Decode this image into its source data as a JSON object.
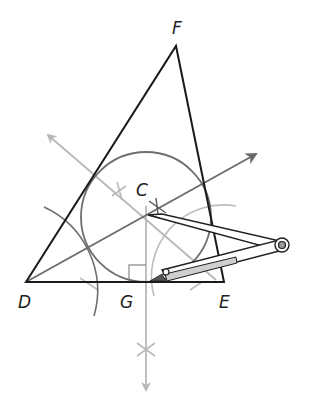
{
  "diagram": {
    "labels": {
      "F": "F",
      "C": "C",
      "D": "D",
      "G": "G",
      "E": "E"
    },
    "points": {
      "D": [
        26,
        282
      ],
      "E": [
        224,
        282
      ],
      "F": [
        176,
        46
      ],
      "C": [
        147,
        216
      ],
      "G": [
        146,
        282
      ]
    },
    "incircle": {
      "center": [
        146,
        217
      ],
      "radius": 65
    },
    "colors": {
      "triangle": "#1a1a1a",
      "circle": "#6e6e6e",
      "bisector_dark": "#6a6a6a",
      "construction_light": "#b8b8b8",
      "compass": "#1f1f1f"
    },
    "elements": [
      "triangle DEF",
      "angle bisector from D (dark gray ray)",
      "angle bisector from F side (light gray ray)",
      "perpendicular from C to DE (light gray ray)",
      "right-angle marker at G",
      "inscribed circle centered at C",
      "compass drawing circle"
    ]
  }
}
